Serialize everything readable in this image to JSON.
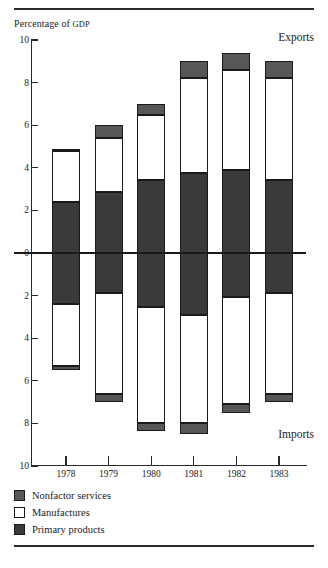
{
  "figure": {
    "axis_title": "Percentage of GDP",
    "axis_title_small": "GDP",
    "axis_title_lead": "Percentage of ",
    "exports_label": "Exports",
    "imports_label": "Imports"
  },
  "legend": {
    "items": [
      {
        "label": "Nonfactor services",
        "key": "nonfactor",
        "color": "#575757"
      },
      {
        "label": "Manufactures",
        "key": "manufactures",
        "color": "#ffffff"
      },
      {
        "label": "Primary products",
        "key": "primary",
        "color": "#3a3a3a"
      }
    ]
  },
  "chart_data": {
    "type": "bar",
    "title": "Percentage of GDP",
    "subtitle": "",
    "xlabel": "",
    "ylabel": "Percentage of GDP",
    "orientation": "vertical",
    "stacked": true,
    "diverging": true,
    "grid": false,
    "legend_position": "bottom-left",
    "categories": [
      "1978",
      "1979",
      "1980",
      "1981",
      "1982",
      "1983"
    ],
    "ylim": [
      -10,
      10
    ],
    "yticks": [
      10,
      8,
      6,
      4,
      2,
      0,
      2,
      4,
      6,
      8,
      10
    ],
    "ytick_values": [
      10,
      8,
      6,
      4,
      2,
      0,
      -2,
      -4,
      -6,
      -8,
      -10
    ],
    "upper_half_label": "Exports",
    "lower_half_label": "Imports",
    "note": "Upper half = Exports (positive), lower half = Imports (plotted downward, labels shown unsigned).",
    "series": [
      {
        "name": "Primary products",
        "color": "#3a3a3a",
        "exports": [
          2.4,
          2.85,
          3.45,
          3.75,
          3.9,
          3.45
        ],
        "imports": [
          2.4,
          1.9,
          2.55,
          2.9,
          2.05,
          1.9
        ]
      },
      {
        "name": "Manufactures",
        "color": "#ffffff",
        "exports": [
          2.4,
          2.55,
          3.05,
          4.45,
          4.7,
          4.75
        ],
        "imports": [
          2.9,
          4.7,
          5.45,
          5.1,
          5.05,
          4.7
        ]
      },
      {
        "name": "Nonfactor services",
        "color": "#575757",
        "exports": [
          0.1,
          0.6,
          0.5,
          0.8,
          0.8,
          0.8
        ],
        "imports": [
          0.2,
          0.4,
          0.35,
          0.5,
          0.4,
          0.4
        ]
      }
    ],
    "export_totals": [
      4.9,
      6.0,
      7.0,
      9.0,
      9.4,
      9.0
    ],
    "import_totals": [
      5.5,
      7.0,
      8.35,
      8.5,
      7.5,
      7.0
    ]
  }
}
